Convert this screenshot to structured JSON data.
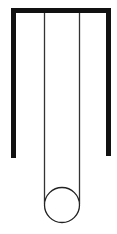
{
  "diagram": {
    "colors": {
      "background": "#ffffff",
      "frame": "#111111",
      "string": "#333333",
      "bob": "#222222"
    },
    "frame": {
      "left_x": 13.5,
      "right_x": 108.5,
      "top_y": 10.5,
      "left_bottom_y": 158,
      "right_bottom_y": 156,
      "stroke_width": 5
    },
    "strings": [
      {
        "x": 44.5,
        "y1": 13,
        "y2": 204
      },
      {
        "x": 79.5,
        "y1": 13,
        "y2": 204
      }
    ],
    "bob": {
      "cx": 62,
      "cy": 205,
      "r": 17.5,
      "stroke_width": 1.3
    }
  }
}
